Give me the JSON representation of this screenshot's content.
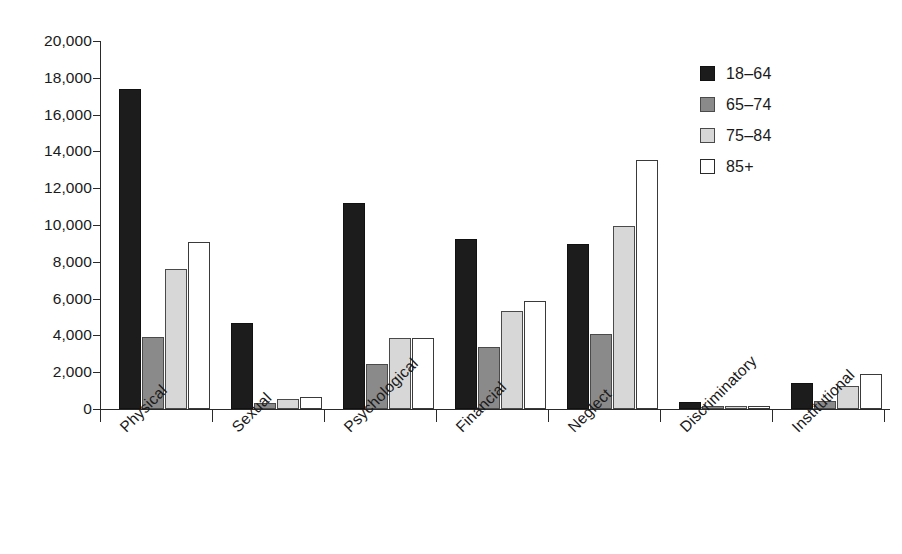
{
  "chart_data": {
    "type": "bar",
    "title": "",
    "subtitle": "",
    "xlabel": "",
    "ylabel": "",
    "ylim": [
      0,
      20000
    ],
    "yticks": [
      0,
      2000,
      4000,
      6000,
      8000,
      10000,
      12000,
      14000,
      16000,
      18000,
      20000
    ],
    "ytick_labels": [
      "0",
      "2,000",
      "4,000",
      "6,000",
      "8,000",
      "10,000",
      "12,000",
      "14,000",
      "16,000",
      "18,000",
      "20,000"
    ],
    "grid": false,
    "legend_position": "top-right",
    "categories": [
      "Physical",
      "Sexual",
      "Psychological",
      "Financial",
      "Neglect",
      "Discriminatory",
      "Institutional"
    ],
    "series": [
      {
        "name": "18–64",
        "color": "#1c1c1c",
        "values": [
          17400,
          4700,
          11200,
          9250,
          8950,
          400,
          1400
        ]
      },
      {
        "name": "65–74",
        "color": "#8a8a8a",
        "values": [
          3900,
          300,
          2450,
          3350,
          4100,
          150,
          450
        ]
      },
      {
        "name": "75–84",
        "color": "#d7d7d7",
        "values": [
          7600,
          550,
          3850,
          5300,
          9950,
          150,
          1250
        ]
      },
      {
        "name": "85+",
        "color": "#ffffff",
        "values": [
          9100,
          650,
          3850,
          5850,
          13550,
          150,
          1900
        ]
      }
    ]
  },
  "axis": {
    "line_color": "#2a2a2a"
  }
}
